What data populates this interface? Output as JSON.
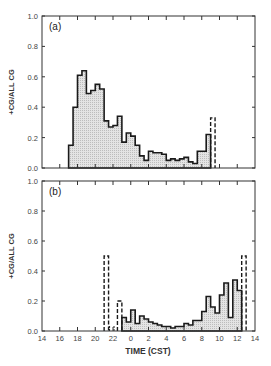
{
  "chart_data": [
    {
      "type": "bar",
      "panel_label": "(a)",
      "title": "",
      "xlabel": "",
      "ylabel": "+CG/ALL CG",
      "ylim": [
        0.0,
        1.0
      ],
      "yticks": [
        "0.0",
        "0.2",
        "0.4",
        "0.6",
        "0.8",
        "1.0"
      ],
      "xlim_hours": [
        14,
        38
      ],
      "bin_width_hours": 0.5,
      "grid": false,
      "bars": [
        {
          "t": 17.0,
          "v": 0.15
        },
        {
          "t": 17.5,
          "v": 0.4
        },
        {
          "t": 18.0,
          "v": 0.61
        },
        {
          "t": 18.5,
          "v": 0.64
        },
        {
          "t": 19.0,
          "v": 0.49
        },
        {
          "t": 19.5,
          "v": 0.51
        },
        {
          "t": 20.0,
          "v": 0.55
        },
        {
          "t": 20.5,
          "v": 0.52
        },
        {
          "t": 21.0,
          "v": 0.31
        },
        {
          "t": 21.5,
          "v": 0.27
        },
        {
          "t": 22.0,
          "v": 0.28
        },
        {
          "t": 22.5,
          "v": 0.34
        },
        {
          "t": 23.0,
          "v": 0.17
        },
        {
          "t": 23.5,
          "v": 0.23
        },
        {
          "t": 24.0,
          "v": 0.21
        },
        {
          "t": 24.5,
          "v": 0.15
        },
        {
          "t": 25.0,
          "v": 0.08
        },
        {
          "t": 25.5,
          "v": 0.05
        },
        {
          "t": 26.0,
          "v": 0.11
        },
        {
          "t": 26.5,
          "v": 0.1
        },
        {
          "t": 27.0,
          "v": 0.1
        },
        {
          "t": 27.5,
          "v": 0.09
        },
        {
          "t": 28.0,
          "v": 0.05
        },
        {
          "t": 28.5,
          "v": 0.06
        },
        {
          "t": 29.0,
          "v": 0.05
        },
        {
          "t": 29.5,
          "v": 0.06
        },
        {
          "t": 30.0,
          "v": 0.07
        },
        {
          "t": 30.5,
          "v": 0.04
        },
        {
          "t": 31.0,
          "v": 0.03
        },
        {
          "t": 31.5,
          "v": 0.11
        },
        {
          "t": 32.0,
          "v": 0.11
        },
        {
          "t": 32.5,
          "v": 0.22
        }
      ],
      "dashed_bars": [
        {
          "t": 33.0,
          "v": 0.33
        }
      ]
    },
    {
      "type": "bar",
      "panel_label": "(b)",
      "title": "",
      "xlabel": "TIME (CST)",
      "ylabel": "+CG/ALL CG",
      "ylim": [
        0.0,
        1.0
      ],
      "yticks": [
        "0.0",
        "0.2",
        "0.4",
        "0.6",
        "0.8",
        "1.0"
      ],
      "xticks": [
        "14",
        "16",
        "18",
        "20",
        "22",
        "0",
        "2",
        "4",
        "6",
        "8",
        "10",
        "12",
        "14"
      ],
      "xlim_hours": [
        14,
        38
      ],
      "bin_width_hours": 0.5,
      "grid": false,
      "bars": [
        {
          "t": 23.0,
          "v": 0.09
        },
        {
          "t": 23.5,
          "v": 0.06
        },
        {
          "t": 24.0,
          "v": 0.14
        },
        {
          "t": 24.5,
          "v": 0.05
        },
        {
          "t": 25.0,
          "v": 0.1
        },
        {
          "t": 25.5,
          "v": 0.08
        },
        {
          "t": 26.0,
          "v": 0.06
        },
        {
          "t": 26.5,
          "v": 0.05
        },
        {
          "t": 27.0,
          "v": 0.04
        },
        {
          "t": 27.5,
          "v": 0.03
        },
        {
          "t": 28.0,
          "v": 0.03
        },
        {
          "t": 28.5,
          "v": 0.02
        },
        {
          "t": 29.0,
          "v": 0.03
        },
        {
          "t": 29.5,
          "v": 0.03
        },
        {
          "t": 30.0,
          "v": 0.05
        },
        {
          "t": 30.5,
          "v": 0.04
        },
        {
          "t": 31.0,
          "v": 0.07
        },
        {
          "t": 31.5,
          "v": 0.07
        },
        {
          "t": 32.0,
          "v": 0.13
        },
        {
          "t": 32.5,
          "v": 0.23
        },
        {
          "t": 33.0,
          "v": 0.16
        },
        {
          "t": 33.5,
          "v": 0.12
        },
        {
          "t": 34.0,
          "v": 0.24
        },
        {
          "t": 34.5,
          "v": 0.32
        },
        {
          "t": 35.0,
          "v": 0.09
        },
        {
          "t": 35.5,
          "v": 0.34
        },
        {
          "t": 36.0,
          "v": 0.27
        }
      ],
      "dashed_bars": [
        {
          "t": 21.0,
          "v": 0.5
        },
        {
          "t": 21.5,
          "v": 0.0
        },
        {
          "t": 22.0,
          "v": 0.0
        },
        {
          "t": 22.5,
          "v": 0.2
        },
        {
          "t": 36.5,
          "v": 0.5
        }
      ]
    }
  ],
  "colors": {
    "fill": "#d9d9d9",
    "stroke": "#1a1a1a",
    "axis": "#333333",
    "text": "#444444"
  }
}
